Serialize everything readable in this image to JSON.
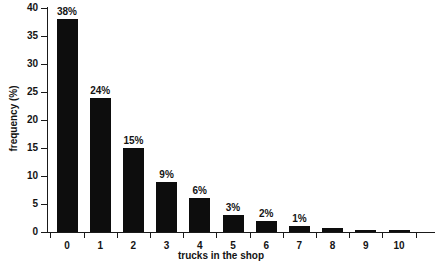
{
  "chart_data": {
    "type": "bar",
    "title": "",
    "subtitle": "",
    "xlabel": "trucks in the shop",
    "ylabel": "frequency (%)",
    "categories": [
      "0",
      "1",
      "2",
      "3",
      "4",
      "5",
      "6",
      "7",
      "8",
      "9",
      "10"
    ],
    "values": [
      38,
      24,
      15,
      9,
      6,
      3,
      2,
      1,
      0.7,
      0.4,
      0.2
    ],
    "data_labels": [
      "38%",
      "24%",
      "15%",
      "9%",
      "6%",
      "3%",
      "2%",
      "1%",
      "",
      "",
      ""
    ],
    "ylim": [
      0,
      40
    ],
    "ytick_values": [
      0,
      5,
      10,
      15,
      20,
      25,
      30,
      35,
      40
    ],
    "ytick_labels": [
      "0",
      "5",
      "10",
      "15",
      "20",
      "25",
      "30",
      "35",
      "40"
    ],
    "grid": false,
    "legend": false,
    "legend_position": "none",
    "bar_color": "#0d0d0d",
    "axis_color": "#1a1a1a",
    "background_color": "#ffffff",
    "text_color": "#141414"
  }
}
